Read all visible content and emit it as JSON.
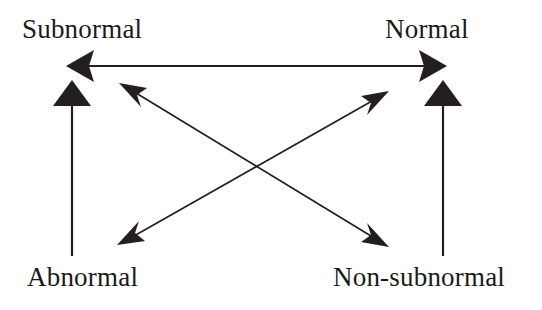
{
  "diagram": {
    "type": "square-of-opposition",
    "background_color": "#ffffff",
    "stroke_color": "#231f20",
    "text_color": "#1a1a1a",
    "nodes": [
      {
        "id": "subnormal",
        "label": "Subnormal",
        "position": "top-left"
      },
      {
        "id": "normal",
        "label": "Normal",
        "position": "top-right"
      },
      {
        "id": "abnormal",
        "label": "Abnormal",
        "position": "bottom-left"
      },
      {
        "id": "non-subnormal",
        "label": "Non-subnormal",
        "position": "bottom-right"
      }
    ],
    "edges": [
      {
        "id": "top-horizontal",
        "from": "subnormal",
        "to": "normal",
        "direction": "bidirectional",
        "style": "solid",
        "arrowheads": "both"
      },
      {
        "id": "left-vertical",
        "from": "abnormal",
        "to": "subnormal",
        "direction": "upward",
        "style": "solid",
        "arrowheads": "end"
      },
      {
        "id": "right-vertical",
        "from": "non-subnormal",
        "to": "normal",
        "direction": "upward",
        "style": "solid",
        "arrowheads": "end"
      },
      {
        "id": "diagonal-abnormal-normal",
        "from": "abnormal",
        "to": "normal",
        "direction": "bidirectional",
        "style": "solid",
        "arrowheads": "both"
      },
      {
        "id": "diagonal-subnormal-non-subnormal",
        "from": "subnormal",
        "to": "non-subnormal",
        "direction": "bidirectional",
        "style": "solid",
        "arrowheads": "both"
      }
    ]
  }
}
